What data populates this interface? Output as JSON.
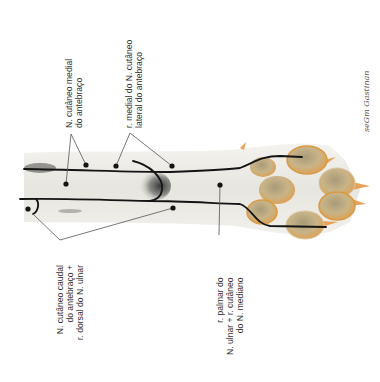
{
  "figure": {
    "colors": {
      "background": "#ffffff",
      "fur": "#ecebe6",
      "fur_shadow": "#c9c8c2",
      "nerve_line": "#141414",
      "leader_line": "#555555",
      "pad_fill": "#c9b48a",
      "pad_edge": "#d99a45",
      "claw": "#e7a35a",
      "text": "#333333"
    }
  },
  "labels": {
    "cutaneo_medial": {
      "lines": [
        "N. cutâneo medial",
        "do antebraço"
      ]
    },
    "ramo_medial_lateral": {
      "lines": [
        "r. medial do N. cutâneo",
        "lateral do antebraço"
      ]
    },
    "cutaneo_caudal": {
      "lines": [
        "N. cutâneo caudal",
        "do antebraço +",
        "r. dorsal do N. ulnar"
      ]
    },
    "palmar_ulnar": {
      "lines": [
        "r. palmar do",
        "N. ulnar + r. cutâneo",
        "do N. mediano"
      ]
    }
  },
  "signature": {
    "text": "seGm Gastinan"
  }
}
